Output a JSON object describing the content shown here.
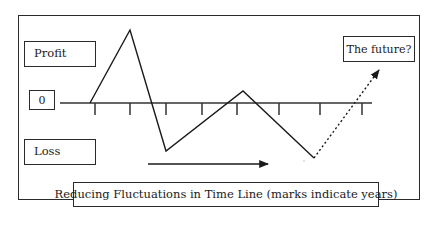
{
  "diagram": {
    "labels": {
      "profit": "Profit",
      "zero": "0",
      "loss": "Loss",
      "future": "The future?",
      "caption": "Reducing Fluctuations in Time Line (marks indicate years)"
    },
    "axis": {
      "y": 103,
      "x_start": 60,
      "x_end": 372,
      "tick_x": [
        95,
        130,
        166,
        202,
        237,
        279,
        320,
        362
      ],
      "tick_length": 12
    },
    "fluctuation_line": {
      "points": [
        [
          90,
          103
        ],
        [
          130,
          30
        ],
        [
          166,
          151
        ],
        [
          243,
          91
        ],
        [
          314,
          158
        ]
      ],
      "meaning": [
        "start at zero",
        "high profit",
        "loss",
        "smaller profit",
        "smaller loss"
      ]
    },
    "future_projection": {
      "style": "dotted",
      "from": [
        314,
        158
      ],
      "to": [
        379,
        70
      ]
    },
    "time_arrow": {
      "from": [
        148,
        164
      ],
      "to": [
        268,
        164
      ]
    },
    "colors": {
      "stroke": "#1a1a1a",
      "frame": "#2a2a2a",
      "background": "#ffffff"
    }
  }
}
